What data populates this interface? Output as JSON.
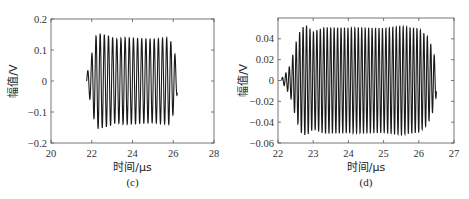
{
  "chart_data": [
    {
      "id": "c",
      "type": "line",
      "caption": "(c)",
      "title": "",
      "xlabel": "时间/μs",
      "ylabel": "幅值/V",
      "xlim": [
        20,
        28
      ],
      "ylim": [
        -0.2,
        0.2
      ],
      "xticks": [
        20,
        22,
        24,
        26,
        28
      ],
      "xtick_labels": [
        "20",
        "22",
        "24",
        "26",
        "28"
      ],
      "yticks": [
        -0.2,
        -0.1,
        0,
        0.1,
        0.2
      ],
      "ytick_labels": [
        "-0.2",
        "-0.1",
        "0",
        "0.1",
        "0.2"
      ],
      "grid": false,
      "legend": null,
      "signal": {
        "description": "Burst sinusoid (tone burst) with ~21 cycles",
        "start_us": 21.75,
        "end_us": 26.2,
        "frequency_MHz": 4.9,
        "envelope": [
          {
            "t": 21.75,
            "amp": 0.02
          },
          {
            "t": 21.95,
            "amp": 0.07
          },
          {
            "t": 22.1,
            "amp": 0.12
          },
          {
            "t": 22.25,
            "amp": 0.155
          },
          {
            "t": 22.6,
            "amp": 0.15
          },
          {
            "t": 22.9,
            "amp": 0.145
          },
          {
            "t": 23.2,
            "amp": 0.135
          },
          {
            "t": 23.6,
            "amp": 0.14
          },
          {
            "t": 25.0,
            "amp": 0.135
          },
          {
            "t": 25.8,
            "amp": 0.14
          },
          {
            "t": 26.05,
            "amp": 0.1
          },
          {
            "t": 26.2,
            "amp": 0.04
          }
        ],
        "approx_peak_max": 0.155,
        "approx_peak_min": -0.145,
        "steady_amplitude": 0.135
      }
    },
    {
      "id": "d",
      "type": "line",
      "caption": "(d)",
      "title": "",
      "xlabel": "时间/μs",
      "ylabel": "幅值/V",
      "xlim": [
        22,
        27
      ],
      "ylim": [
        -0.06,
        0.06
      ],
      "xticks": [
        22,
        23,
        24,
        25,
        26,
        27
      ],
      "xtick_labels": [
        "22",
        "23",
        "24",
        "25",
        "26",
        "27"
      ],
      "yticks": [
        -0.06,
        -0.04,
        -0.02,
        0,
        0.02,
        0.04
      ],
      "ytick_labels": [
        "-0.06",
        "-0.04",
        "-0.02",
        "0",
        "0.02",
        "0.04"
      ],
      "grid": false,
      "legend": null,
      "signal": {
        "description": "Burst sinusoid with ramp-up and ramp-down envelope, ~45 cycles",
        "start_us": 22.1,
        "end_us": 26.5,
        "frequency_MHz": 10.2,
        "envelope": [
          {
            "t": 22.1,
            "amp": 0.002
          },
          {
            "t": 22.2,
            "amp": 0.006
          },
          {
            "t": 22.35,
            "amp": 0.015
          },
          {
            "t": 22.5,
            "amp": 0.035
          },
          {
            "t": 22.65,
            "amp": 0.05
          },
          {
            "t": 22.8,
            "amp": 0.053
          },
          {
            "t": 23.0,
            "amp": 0.047
          },
          {
            "t": 23.3,
            "amp": 0.051
          },
          {
            "t": 25.0,
            "amp": 0.05
          },
          {
            "t": 25.5,
            "amp": 0.052
          },
          {
            "t": 26.0,
            "amp": 0.05
          },
          {
            "t": 26.25,
            "amp": 0.042
          },
          {
            "t": 26.4,
            "amp": 0.03
          },
          {
            "t": 26.5,
            "amp": 0.015
          }
        ],
        "approx_peak_max": 0.053,
        "approx_peak_min": -0.053,
        "steady_amplitude": 0.051
      }
    }
  ],
  "layout": {
    "c": {
      "plot": {
        "left": 51,
        "top": 19,
        "right": 214,
        "bottom": 143
      }
    },
    "d": {
      "plot": {
        "left": 43,
        "top": 18,
        "right": 219,
        "bottom": 143
      }
    }
  },
  "colors": {
    "axis": "#555555",
    "trace": "#1a1a1a",
    "background": "#ffffff"
  }
}
